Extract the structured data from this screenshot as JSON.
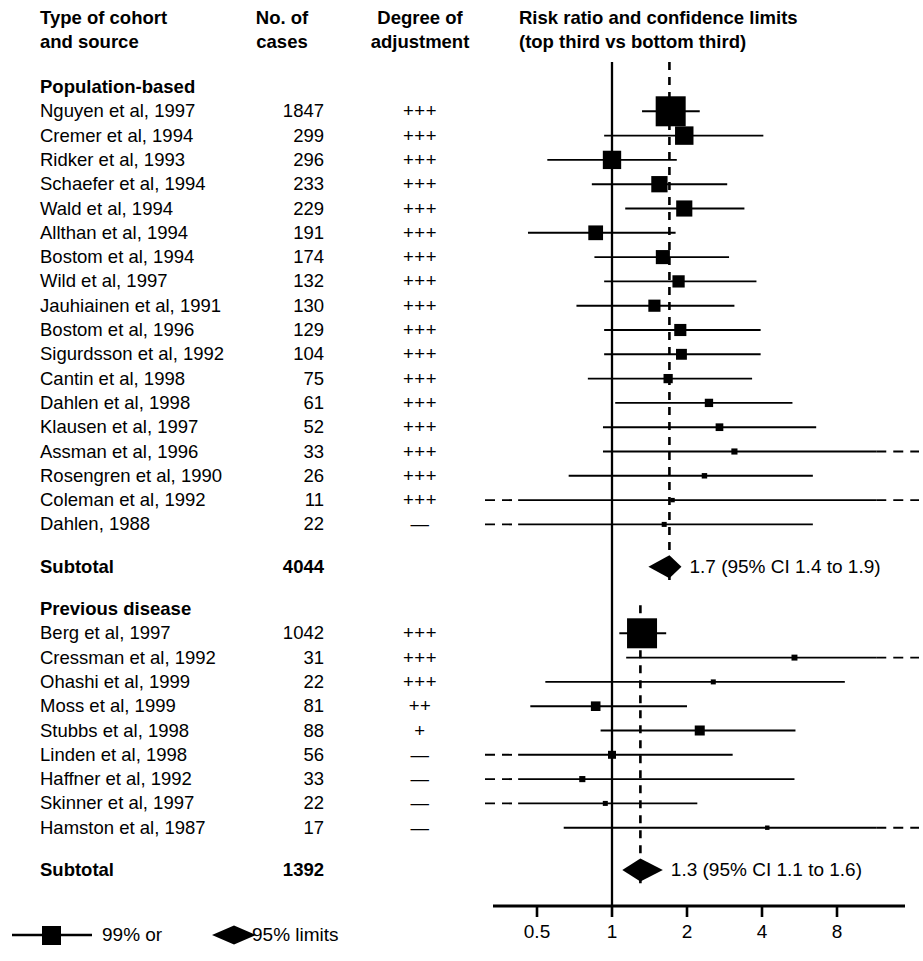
{
  "headers": {
    "study": "Type of cohort\nand source",
    "cases": "No. of\ncases",
    "adjustment": "Degree of\nadjustment",
    "plot": "Risk ratio and confidence limits\n(top third vs bottom third)"
  },
  "groups": [
    {
      "name": "Population-based",
      "subtotal_label": "Subtotal",
      "subtotal_cases": "4044",
      "subtotal_result": "1.7 (95% CI 1.4 to 1.9)",
      "rows": [
        {
          "label": "Nguyen et al, 1997",
          "cases": "1847",
          "adjustment": "+++"
        },
        {
          "label": "Cremer et al, 1994",
          "cases": "299",
          "adjustment": "+++"
        },
        {
          "label": "Ridker et al, 1993",
          "cases": "296",
          "adjustment": "+++"
        },
        {
          "label": "Schaefer et al, 1994",
          "cases": "233",
          "adjustment": "+++"
        },
        {
          "label": "Wald et al, 1994",
          "cases": "229",
          "adjustment": "+++"
        },
        {
          "label": "Allthan et al, 1994",
          "cases": "191",
          "adjustment": "+++"
        },
        {
          "label": "Bostom et al, 1994",
          "cases": "174",
          "adjustment": "+++"
        },
        {
          "label": "Wild et al, 1997",
          "cases": "132",
          "adjustment": "+++"
        },
        {
          "label": "Jauhiainen et al, 1991",
          "cases": "130",
          "adjustment": "+++"
        },
        {
          "label": "Bostom et al, 1996",
          "cases": "129",
          "adjustment": "+++"
        },
        {
          "label": "Sigurdsson et al, 1992",
          "cases": "104",
          "adjustment": "+++"
        },
        {
          "label": "Cantin et al, 1998",
          "cases": "75",
          "adjustment": "+++"
        },
        {
          "label": "Dahlen et al, 1998",
          "cases": "61",
          "adjustment": "+++"
        },
        {
          "label": "Klausen et al, 1997",
          "cases": "52",
          "adjustment": "+++"
        },
        {
          "label": "Assman et al, 1996",
          "cases": "33",
          "adjustment": "+++"
        },
        {
          "label": "Rosengren et al, 1990",
          "cases": "26",
          "adjustment": "+++"
        },
        {
          "label": "Coleman et al, 1992",
          "cases": "11",
          "adjustment": "+++"
        },
        {
          "label": "Dahlen, 1988",
          "cases": "22",
          "adjustment": "—"
        }
      ]
    },
    {
      "name": "Previous disease",
      "subtotal_label": "Subtotal",
      "subtotal_cases": "1392",
      "subtotal_result": "1.3 (95% CI 1.1 to 1.6)",
      "rows": [
        {
          "label": "Berg et al, 1997",
          "cases": "1042",
          "adjustment": "+++"
        },
        {
          "label": "Cressman et al, 1992",
          "cases": "31",
          "adjustment": "+++"
        },
        {
          "label": "Ohashi et al, 1999",
          "cases": "22",
          "adjustment": "+++"
        },
        {
          "label": "Moss et al, 1999",
          "cases": "81",
          "adjustment": "++"
        },
        {
          "label": "Stubbs et al, 1998",
          "cases": "88",
          "adjustment": "+"
        },
        {
          "label": "Linden et al, 1998",
          "cases": "56",
          "adjustment": "—"
        },
        {
          "label": "Haffner et al, 1992",
          "cases": "33",
          "adjustment": "—"
        },
        {
          "label": "Skinner et al, 1997",
          "cases": "22",
          "adjustment": "—"
        },
        {
          "label": "Hamston et al, 1987",
          "cases": "17",
          "adjustment": "—"
        }
      ]
    }
  ],
  "legend": {
    "ci99_label": "99% or",
    "ci95_label": "95% limits"
  },
  "chart_data": {
    "type": "forest",
    "title": "Risk ratio and confidence limits (top third vs bottom third)",
    "xlabel": "",
    "x_scale": "log",
    "xlim": [
      0.42,
      11.5
    ],
    "ticks": [
      0.5,
      1,
      2,
      4,
      8
    ],
    "tick_labels": [
      "0.5",
      "1",
      "2",
      "4",
      "8"
    ],
    "null_line": 1,
    "grid": false,
    "marker_ci": "99%",
    "summary_ci": "95%",
    "series": [
      {
        "group": "Population-based",
        "reference_line": 1.7,
        "points": [
          {
            "study": "Nguyen et al, 1997",
            "rr": 1.72,
            "lo": 1.32,
            "hi": 2.25,
            "weight": 1847,
            "lo_open": false,
            "hi_open": false
          },
          {
            "study": "Cremer et al, 1994",
            "rr": 1.95,
            "lo": 0.93,
            "hi": 4.05,
            "weight": 299,
            "lo_open": false,
            "hi_open": false
          },
          {
            "study": "Ridker et al, 1993",
            "rr": 1.0,
            "lo": 0.55,
            "hi": 1.82,
            "weight": 296,
            "lo_open": false,
            "hi_open": false
          },
          {
            "study": "Schaefer et al, 1994",
            "rr": 1.55,
            "lo": 0.83,
            "hi": 2.9,
            "weight": 233,
            "lo_open": false,
            "hi_open": false
          },
          {
            "study": "Wald et al, 1994",
            "rr": 1.95,
            "lo": 1.13,
            "hi": 3.4,
            "weight": 229,
            "lo_open": false,
            "hi_open": false
          },
          {
            "study": "Allthan et al, 1994",
            "rr": 0.86,
            "lo": 0.46,
            "hi": 1.8,
            "weight": 191,
            "lo_open": false,
            "hi_open": false
          },
          {
            "study": "Bostom et al, 1994",
            "rr": 1.6,
            "lo": 0.85,
            "hi": 2.95,
            "weight": 174,
            "lo_open": false,
            "hi_open": false
          },
          {
            "study": "Wild et al, 1997",
            "rr": 1.85,
            "lo": 0.93,
            "hi": 3.8,
            "weight": 132,
            "lo_open": false,
            "hi_open": false
          },
          {
            "study": "Jauhiainen et al, 1991",
            "rr": 1.48,
            "lo": 0.72,
            "hi": 3.1,
            "weight": 130,
            "lo_open": false,
            "hi_open": false
          },
          {
            "study": "Bostom et al, 1996",
            "rr": 1.88,
            "lo": 0.93,
            "hi": 3.95,
            "weight": 129,
            "lo_open": false,
            "hi_open": false
          },
          {
            "study": "Sigurdsson et al, 1992",
            "rr": 1.9,
            "lo": 0.93,
            "hi": 3.95,
            "weight": 104,
            "lo_open": false,
            "hi_open": false
          },
          {
            "study": "Cantin et al, 1998",
            "rr": 1.68,
            "lo": 0.8,
            "hi": 3.65,
            "weight": 75,
            "lo_open": false,
            "hi_open": false
          },
          {
            "study": "Dahlen et al, 1998",
            "rr": 2.45,
            "lo": 1.03,
            "hi": 5.3,
            "weight": 61,
            "lo_open": false,
            "hi_open": false
          },
          {
            "study": "Klausen et al, 1997",
            "rr": 2.7,
            "lo": 0.92,
            "hi": 6.6,
            "weight": 52,
            "lo_open": false,
            "hi_open": false
          },
          {
            "study": "Assman et al, 1996",
            "rr": 3.1,
            "lo": 0.92,
            "hi": 11.5,
            "weight": 33,
            "lo_open": false,
            "hi_open": true
          },
          {
            "study": "Rosengren et al, 1990",
            "rr": 2.35,
            "lo": 0.67,
            "hi": 6.4,
            "weight": 26,
            "lo_open": false,
            "hi_open": false
          },
          {
            "study": "Coleman et al, 1992",
            "rr": 1.75,
            "lo": 0.42,
            "hi": 11.5,
            "weight": 11,
            "lo_open": true,
            "hi_open": true
          },
          {
            "study": "Dahlen, 1988",
            "rr": 1.62,
            "lo": 0.42,
            "hi": 6.4,
            "weight": 22,
            "lo_open": true,
            "hi_open": false
          }
        ],
        "summary": {
          "rr": 1.7,
          "lo": 1.4,
          "hi": 1.9,
          "label": "1.7 (95% CI 1.4 to 1.9)"
        }
      },
      {
        "group": "Previous disease",
        "reference_line": 1.3,
        "points": [
          {
            "study": "Berg et al, 1997",
            "rr": 1.32,
            "lo": 1.07,
            "hi": 1.65,
            "weight": 1042,
            "lo_open": false,
            "hi_open": false
          },
          {
            "study": "Cressman et al, 1992",
            "rr": 5.4,
            "lo": 1.14,
            "hi": 11.5,
            "weight": 31,
            "lo_open": false,
            "hi_open": true
          },
          {
            "study": "Ohashi et al, 1999",
            "rr": 2.55,
            "lo": 0.54,
            "hi": 8.6,
            "weight": 22,
            "lo_open": false,
            "hi_open": false
          },
          {
            "study": "Moss et al, 1999",
            "rr": 0.86,
            "lo": 0.47,
            "hi": 2.0,
            "weight": 81,
            "lo_open": false,
            "hi_open": false
          },
          {
            "study": "Stubbs et al, 1998",
            "rr": 2.25,
            "lo": 0.9,
            "hi": 5.45,
            "weight": 88,
            "lo_open": false,
            "hi_open": false
          },
          {
            "study": "Linden et al, 1998",
            "rr": 1.0,
            "lo": 0.42,
            "hi": 3.05,
            "weight": 56,
            "lo_open": true,
            "hi_open": false
          },
          {
            "study": "Haffner et al, 1992",
            "rr": 0.76,
            "lo": 0.42,
            "hi": 5.4,
            "weight": 33,
            "lo_open": true,
            "hi_open": false
          },
          {
            "study": "Skinner et al, 1997",
            "rr": 0.94,
            "lo": 0.42,
            "hi": 2.2,
            "weight": 22,
            "lo_open": true,
            "hi_open": false
          },
          {
            "study": "Hamston et al, 1987",
            "rr": 4.2,
            "lo": 0.64,
            "hi": 11.5,
            "weight": 17,
            "lo_open": false,
            "hi_open": true
          }
        ],
        "summary": {
          "rr": 1.3,
          "lo": 1.1,
          "hi": 1.6,
          "label": "1.3 (95% CI 1.1 to 1.6)"
        }
      }
    ]
  }
}
